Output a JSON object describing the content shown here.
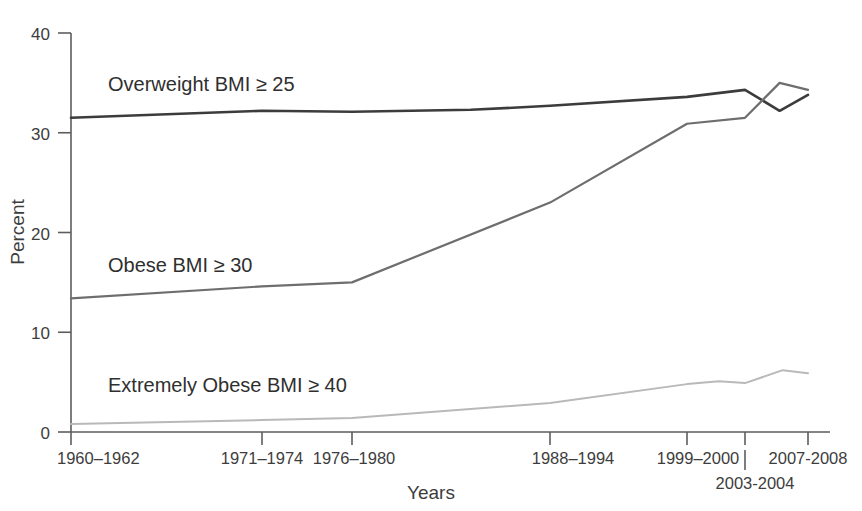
{
  "chart_data": {
    "type": "line",
    "title": "",
    "xlabel": "Years",
    "ylabel": "Percent",
    "ylim": [
      0,
      40
    ],
    "ytick_values": [
      0,
      10,
      20,
      30,
      40
    ],
    "ytick_labels": [
      "0",
      "10",
      "20",
      "30",
      "40"
    ],
    "grid": false,
    "legend_position": "inline-labels",
    "categories": [
      "1960–1962",
      "1971–1974",
      "1976–1980",
      "1988–1994",
      "1999–2000",
      "2003-2004",
      "2007-2008"
    ],
    "xtick_labels": [
      {
        "text": "1960–1962",
        "x_value": 0
      },
      {
        "text": "1971–1974",
        "x_value": 1
      },
      {
        "text": "1976–1980",
        "x_value": 2
      },
      {
        "text": "1988–1994",
        "x_value": 3
      },
      {
        "text": "1999–2000",
        "x_value": 4
      },
      {
        "text": "2003-2004",
        "x_value": 5
      },
      {
        "text": "2007-2008",
        "x_value": 6
      }
    ],
    "series": [
      {
        "name": "Overweight  BMI ≥ 25",
        "label_text": "Overweight   BMI ≥ 25",
        "color": "#3c3c3c",
        "values": [
          31.5,
          32.2,
          32.1,
          32.7,
          33.6,
          34.3,
          33.8
        ],
        "midpoints": [
          {
            "x_value": 2.6,
            "value": 32.3
          },
          {
            "x_value": 5.55,
            "value": 32.2
          }
        ]
      },
      {
        "name": "Obese  BMI ≥ 30",
        "label_text": "Obese   BMI ≥ 30",
        "color": "#6e6e6e",
        "values": [
          13.4,
          14.6,
          15.0,
          23.0,
          30.9,
          31.5,
          34.3
        ],
        "midpoints": [
          {
            "x_value": 5.55,
            "value": 35.0
          }
        ]
      },
      {
        "name": "Extremely Obese  BMI ≥ 40",
        "label_text": "Extremely Obese   BMI ≥ 40",
        "color": "#b9b9b9",
        "values": [
          0.8,
          1.2,
          1.4,
          2.9,
          4.8,
          4.9,
          5.9
        ],
        "midpoints": [
          {
            "x_value": 4.55,
            "value": 5.1
          },
          {
            "x_value": 5.6,
            "value": 6.2
          }
        ]
      }
    ],
    "series_labels": [
      {
        "text": "Overweight   BMI ≥ 25",
        "px_x": 108,
        "px_y": 91
      },
      {
        "text": "Obese   BMI ≥ 30",
        "px_x": 108,
        "px_y": 272
      },
      {
        "text": "Extremely Obese   BMI ≥ 40",
        "px_x": 108,
        "px_y": 392
      }
    ],
    "colors": {
      "overweight": "#3c3c3c",
      "obese": "#6e6e6e",
      "extremely_obese": "#b9b9b9",
      "axis": "#5d5d5d",
      "text": "#3d3d3d",
      "background": "#ffffff"
    }
  }
}
